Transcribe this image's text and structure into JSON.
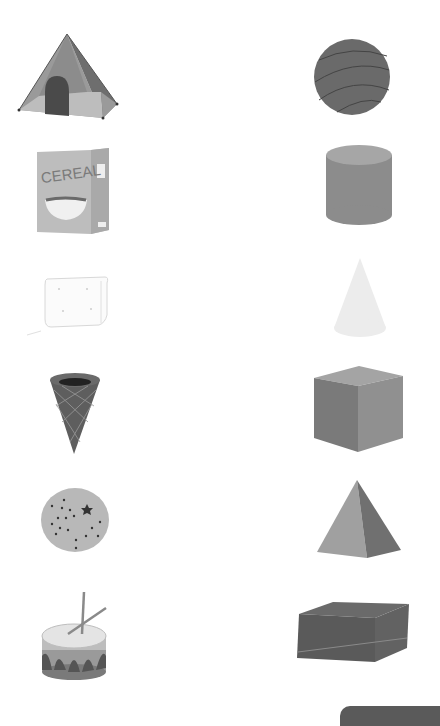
{
  "worksheet": {
    "left_column": [
      {
        "name": "tent",
        "shape_match": "pyramid/cone"
      },
      {
        "name": "cereal box",
        "label": "CEREAL"
      },
      {
        "name": "sugar cube"
      },
      {
        "name": "ice cream cone"
      },
      {
        "name": "orange"
      },
      {
        "name": "drum"
      }
    ],
    "right_column": [
      {
        "name": "sphere"
      },
      {
        "name": "cylinder"
      },
      {
        "name": "cone"
      },
      {
        "name": "cube"
      },
      {
        "name": "pyramid"
      },
      {
        "name": "rectangular prism"
      }
    ]
  },
  "cereal": {
    "label": "CEREAL"
  },
  "colors": {
    "background": "#ffffff",
    "dark": "#5a5a5a",
    "mid": "#8a8a8a",
    "light": "#b8b8b8",
    "pale": "#eeeeee"
  }
}
